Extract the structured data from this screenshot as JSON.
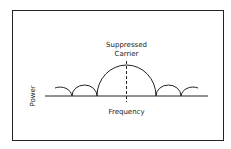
{
  "diagram": {
    "labels": {
      "carrier_line1": "Suppressed",
      "carrier_line2": "Carrier",
      "x_axis": "Frequency",
      "y_axis": "Power"
    },
    "colors": {
      "stroke": "#222222",
      "background": "#ffffff"
    },
    "lobes": [
      {
        "name": "side-lobe-left-2",
        "type": "partial"
      },
      {
        "name": "side-lobe-left-1",
        "type": "full"
      },
      {
        "name": "main-lobe",
        "type": "full"
      },
      {
        "name": "side-lobe-right-1",
        "type": "full"
      },
      {
        "name": "side-lobe-right-2",
        "type": "partial"
      }
    ]
  }
}
